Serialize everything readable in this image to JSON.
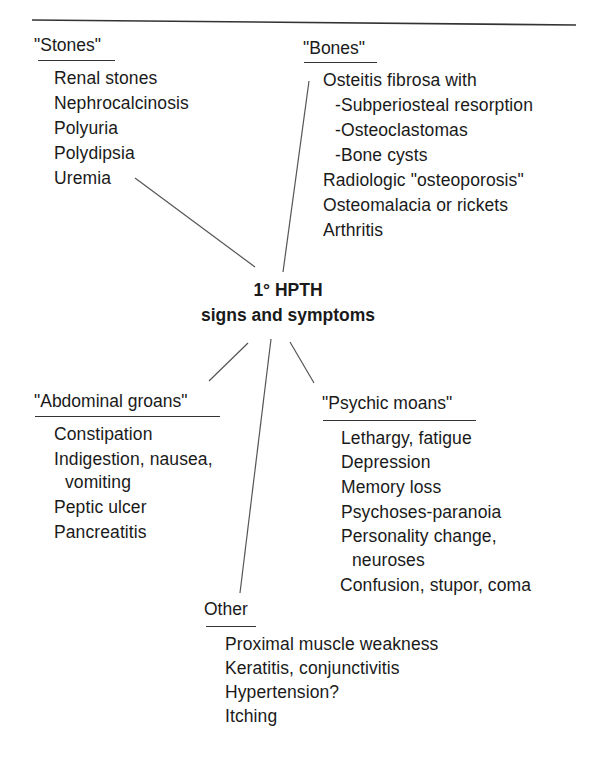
{
  "diagram": {
    "title_line1": "1° HPTH",
    "title_line2": "signs and symptoms",
    "colors": {
      "text": "#1a1a1a",
      "lines": "#555555",
      "background": "#ffffff"
    },
    "groups": {
      "stones": {
        "header": "\"Stones\"",
        "items": [
          "Renal stones",
          "Nephrocalcinosis",
          "Polyuria",
          "Polydipsia",
          "Uremia"
        ]
      },
      "bones": {
        "header": "\"Bones\"",
        "items": [
          "Osteitis fibrosa with",
          "-Subperiosteal resorption",
          "-Osteoclastomas",
          "-Bone cysts",
          "Radiologic \"osteoporosis\"",
          "Osteomalacia or rickets",
          "Arthritis"
        ]
      },
      "abdominal": {
        "header": "\"Abdominal groans\"",
        "items": [
          "Constipation",
          "Indigestion, nausea,",
          "vomiting",
          "Peptic ulcer",
          "Pancreatitis"
        ]
      },
      "psychic": {
        "header": "\"Psychic moans\"",
        "items": [
          "Lethargy, fatigue",
          "Depression",
          "Memory loss",
          "Psychoses-paranoia",
          "Personality change,",
          "neuroses",
          "Confusion, stupor, coma"
        ]
      },
      "other": {
        "header": "Other",
        "items": [
          "Proximal muscle weakness",
          "Keratitis, conjunctivitis",
          "Hypertension?",
          "Itching"
        ]
      }
    }
  }
}
